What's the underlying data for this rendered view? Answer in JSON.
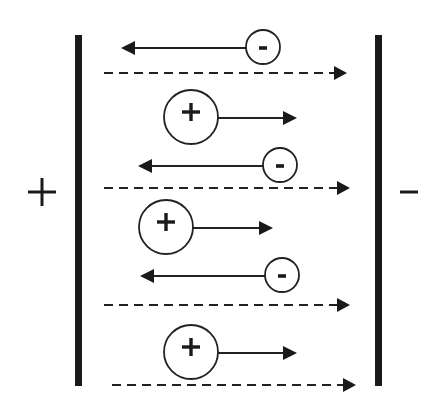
{
  "diagram": {
    "background": "#ffffff",
    "ink_color": "#1a1a1a",
    "left_plate": {
      "polarity": "+",
      "x": 75,
      "y": 35,
      "width": 7,
      "height": 351,
      "sign_center": [
        42,
        192
      ]
    },
    "right_plate": {
      "polarity": "-",
      "x": 375,
      "y": 35,
      "width": 7,
      "height": 351,
      "sign_center": [
        409,
        192
      ]
    },
    "field_lines": [
      {
        "x1": 104,
        "x2": 347,
        "y": 73,
        "direction": "right"
      },
      {
        "x1": 104,
        "x2": 350,
        "y": 188,
        "direction": "right"
      },
      {
        "x1": 104,
        "x2": 350,
        "y": 305,
        "direction": "right"
      },
      {
        "x1": 112,
        "x2": 356,
        "y": 385,
        "direction": "right"
      }
    ],
    "ions": [
      {
        "charge": "-",
        "cx": 263,
        "cy": 47,
        "r": 17,
        "arrow_to_x": 121,
        "direction": "left"
      },
      {
        "charge": "+",
        "cx": 191,
        "cy": 117,
        "r": 27,
        "arrow_to_x": 297,
        "direction": "right"
      },
      {
        "charge": "-",
        "cx": 280,
        "cy": 165,
        "r": 17,
        "arrow_to_x": 138,
        "direction": "left"
      },
      {
        "charge": "+",
        "cx": 166,
        "cy": 227,
        "r": 27,
        "arrow_to_x": 273,
        "direction": "right"
      },
      {
        "charge": "-",
        "cx": 282,
        "cy": 275,
        "r": 17,
        "arrow_to_x": 140,
        "direction": "left"
      },
      {
        "charge": "+",
        "cx": 191,
        "cy": 352,
        "r": 27,
        "arrow_to_x": 297,
        "direction": "right"
      }
    ],
    "labels": {
      "left_plate_sign": "+",
      "right_plate_sign": "-",
      "positive_ion": "+",
      "negative_ion": "-"
    }
  }
}
